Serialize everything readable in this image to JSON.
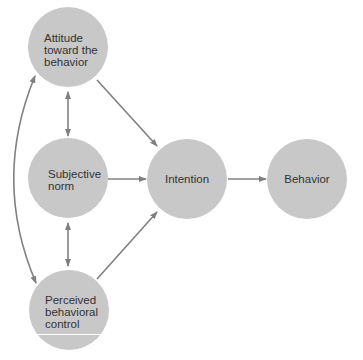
{
  "diagram": {
    "colors": {
      "node_fill": "#c8c8c8",
      "arrow": "#808080",
      "text": "#333333"
    },
    "nodes": [
      {
        "id": "attitude",
        "label_lines": [
          "Attitude",
          "toward the",
          "behavior"
        ]
      },
      {
        "id": "subjective_norm",
        "label_lines": [
          "Subjective",
          "norm"
        ]
      },
      {
        "id": "perceived_control",
        "label_lines": [
          "Perceived",
          "behavioral",
          "control"
        ]
      },
      {
        "id": "intention",
        "label_lines": [
          "Intention"
        ]
      },
      {
        "id": "behavior",
        "label_lines": [
          "Behavior"
        ]
      }
    ],
    "edges": [
      {
        "from": "attitude",
        "to": "intention",
        "type": "directed"
      },
      {
        "from": "subjective_norm",
        "to": "intention",
        "type": "directed"
      },
      {
        "from": "perceived_control",
        "to": "intention",
        "type": "directed"
      },
      {
        "from": "intention",
        "to": "behavior",
        "type": "directed"
      },
      {
        "from": "attitude",
        "to": "subjective_norm",
        "type": "bidirectional"
      },
      {
        "from": "subjective_norm",
        "to": "perceived_control",
        "type": "bidirectional"
      },
      {
        "from": "attitude",
        "to": "perceived_control",
        "type": "bidirectional-curved"
      }
    ]
  }
}
